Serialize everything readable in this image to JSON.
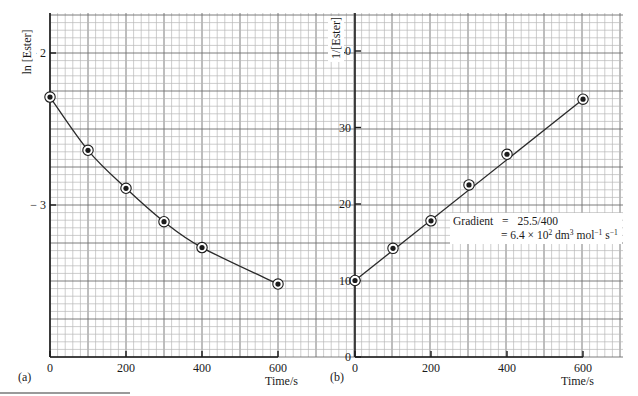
{
  "chart_data": [
    {
      "panel": "(a)",
      "type": "line",
      "title": "",
      "xlabel": "Time/s",
      "ylabel": "ln [Ester]",
      "xlim": [
        0,
        700
      ],
      "ylim": [
        -4.0,
        -1.75
      ],
      "xticks": [
        0,
        200,
        400,
        600
      ],
      "xtick_labels": [
        "0",
        "200",
        "400",
        "600"
      ],
      "yticks": [
        -2,
        -3
      ],
      "ytick_labels": [
        "− 2",
        "− 3"
      ],
      "grid": true,
      "fit": "smooth curve",
      "series": [
        {
          "name": "ln [Ester]",
          "x": [
            0,
            100,
            200,
            300,
            400,
            600
          ],
          "values": [
            -2.29,
            -2.64,
            -2.89,
            -3.11,
            -3.28,
            -3.52
          ]
        }
      ]
    },
    {
      "panel": "(b)",
      "type": "line",
      "title": "",
      "xlabel": "Time/s",
      "ylabel": "1/[Ester]",
      "xlim": [
        0,
        700
      ],
      "ylim": [
        0,
        45
      ],
      "xticks": [
        0,
        200,
        400,
        600
      ],
      "xtick_labels": [
        "0",
        "200",
        "400",
        "600"
      ],
      "yticks": [
        0,
        10,
        20,
        30,
        40
      ],
      "ytick_labels": [
        "0",
        "10",
        "20",
        "30",
        "40"
      ],
      "grid": true,
      "fit": "straight line",
      "series": [
        {
          "name": "1/[Ester]",
          "x": [
            0,
            100,
            200,
            300,
            400,
            600
          ],
          "values": [
            10.0,
            14.2,
            17.8,
            22.5,
            26.5,
            33.7
          ]
        }
      ],
      "annotations": [
        "Gradient = 25.5/400",
        "= 6.4 × 10² dm³ mol⁻¹ s⁻¹"
      ]
    }
  ],
  "labels": {
    "panel_a": "(a)",
    "panel_b": "(b)",
    "a_ylabel": "ln [Ester]",
    "b_ylabel": "1/[Ester]",
    "a_xlabel": "Time/s",
    "b_xlabel": "Time/s",
    "gradient_line1_label": "Gradient",
    "gradient_line1_eq": "=",
    "gradient_line1_value": "25.5/400",
    "gradient_line2": "= 6.4 × 10",
    "gradient_line2_exp": "2",
    "gradient_line2_unit1": " dm",
    "gradient_line2_unit1_exp": "3",
    "gradient_line2_unit2": " mol",
    "gradient_line2_unit2_exp": "−1",
    "gradient_line2_unit3": " s",
    "gradient_line2_unit3_exp": "−1"
  },
  "colors": {
    "grid_minor": "#b8b8b8",
    "grid_major": "#6e6e6e",
    "axis": "#1a1a1a",
    "curve": "#2a2a2a",
    "marker": "#1a1a1a"
  }
}
